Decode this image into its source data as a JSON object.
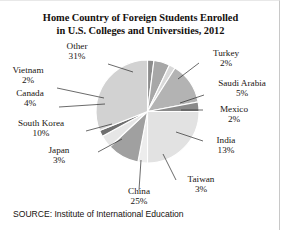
{
  "figure": {
    "title_line1": "Home Country of Foreign Students Enrolled",
    "title_line2": "in U.S. Colleges and Universities, 2012",
    "source": "SOURCE: Institute of International Education"
  },
  "chart_data": {
    "type": "pie",
    "title": "Home Country of Foreign Students Enrolled in U.S. Colleges and Universities, 2012",
    "xlabel": "",
    "ylabel": "",
    "units": "percent",
    "start_angle_deg": 0,
    "direction": "clockwise",
    "legend": "none",
    "grid": false,
    "categories": [
      "Turkey",
      "Saudi Arabia",
      "Mexico",
      "India",
      "Taiwan",
      "China",
      "Japan",
      "South Korea",
      "Canada",
      "Vietnam",
      "Other"
    ],
    "values": [
      2,
      5,
      2,
      13,
      3,
      25,
      3,
      10,
      4,
      2,
      31
    ],
    "slices": [
      {
        "label": "Turkey",
        "pct_text": "2%",
        "value": 2,
        "color": "#8d8d8d"
      },
      {
        "label": "Saudi Arabia",
        "pct_text": "5%",
        "value": 5,
        "color": "#a7a7a7"
      },
      {
        "label": "Mexico",
        "pct_text": "2%",
        "value": 2,
        "color": "#d9d9d9"
      },
      {
        "label": "India",
        "pct_text": "13%",
        "value": 13,
        "color": "#b3b3b3"
      },
      {
        "label": "Taiwan",
        "pct_text": "3%",
        "value": 3,
        "color": "#8a8a8a"
      },
      {
        "label": "China",
        "pct_text": "25%",
        "value": 25,
        "color": "#e2e2e2"
      },
      {
        "label": "Japan",
        "pct_text": "3%",
        "value": 3,
        "color": "#ededed"
      },
      {
        "label": "South Korea",
        "pct_text": "10%",
        "value": 10,
        "color": "#a0a0a0"
      },
      {
        "label": "Canada",
        "pct_text": "4%",
        "value": 4,
        "color": "#e6e6e6"
      },
      {
        "label": "Vietnam",
        "pct_text": "2%",
        "value": 2,
        "color": "#6f6f6f"
      },
      {
        "label": "Other",
        "pct_text": "31%",
        "value": 31,
        "color": "#d2d2d2"
      }
    ]
  },
  "labels": {
    "other": {
      "name": "Other",
      "pct": "31%"
    },
    "vietnam": {
      "name": "Vietnam",
      "pct": "2%"
    },
    "canada": {
      "name": "Canada",
      "pct": "4%"
    },
    "south_korea": {
      "name": "South Korea",
      "pct": "10%"
    },
    "japan": {
      "name": "Japan",
      "pct": "3%"
    },
    "china": {
      "name": "China",
      "pct": "25%"
    },
    "taiwan": {
      "name": "Taiwan",
      "pct": "3%"
    },
    "india": {
      "name": "India",
      "pct": "13%"
    },
    "mexico": {
      "name": "Mexico",
      "pct": "2%"
    },
    "saudi_arabia": {
      "name": "Saudi Arabia",
      "pct": "5%"
    },
    "turkey": {
      "name": "Turkey",
      "pct": "2%"
    }
  }
}
